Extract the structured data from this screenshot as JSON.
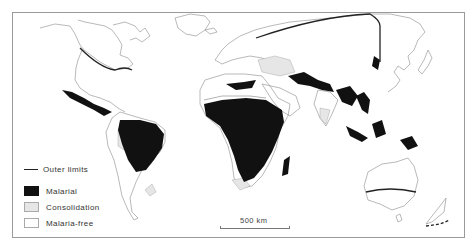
{
  "map": {
    "subject": "World distribution of malaria",
    "legend": {
      "items": [
        {
          "key": "outer-limits",
          "label": "Outer limits",
          "style": "line",
          "color": "#222222"
        },
        {
          "key": "malarial",
          "label": "Malarial",
          "style": "fill",
          "color": "#111111"
        },
        {
          "key": "consolidation",
          "label": "Consolidation",
          "style": "fill",
          "color": "#e6e6e6"
        },
        {
          "key": "malaria-free",
          "label": "Malaria-free",
          "style": "fill",
          "color": "#ffffff"
        }
      ]
    },
    "scale_bar": {
      "label": "500 km"
    },
    "colors": {
      "frame": "#9a9a9a",
      "coastline": "#888888",
      "malarial": "#111111",
      "consolidation": "#e6e6e6",
      "outer_limit_line": "#222222"
    }
  }
}
